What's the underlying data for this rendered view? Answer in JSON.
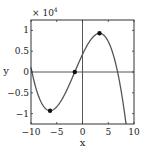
{
  "chart_data": {
    "type": "line",
    "title": "",
    "xlabel": "x",
    "ylabel": "y",
    "y_multiplier_label": "× 10",
    "y_multiplier_exponent": "4",
    "xlim": [
      -10,
      10
    ],
    "ylim": [
      -1.25,
      1.25
    ],
    "y_scale": 10000,
    "grid": false,
    "legend": null,
    "x_ticks": [
      -10,
      -5,
      0,
      5,
      10
    ],
    "x_tick_labels": [
      "−10",
      "−5",
      "0",
      "5",
      "10"
    ],
    "y_ticks": [
      -1,
      -0.5,
      0,
      0.5,
      1
    ],
    "y_tick_labels": [
      "−1",
      "−0.5",
      "0",
      "0.5",
      "1"
    ],
    "reference_lines": {
      "x0": true,
      "y0": true
    },
    "series": [
      {
        "name": "cubic",
        "color": "#555555",
        "function": "y = -42*(x+1.5)^3 + 2903*(x+1.5)",
        "x": [
          -10,
          -9,
          -8,
          -7,
          -6.3,
          -5,
          -4,
          -3,
          -2,
          -1.5,
          -1,
          0,
          1,
          2,
          3,
          3.3,
          4,
          5,
          6,
          7,
          8,
          8.5
        ],
        "y_scaled": [
          0.11,
          -0.34,
          -0.66,
          -0.85,
          -0.93,
          -0.85,
          -0.66,
          -0.42,
          -0.14,
          0.0,
          0.14,
          0.42,
          0.66,
          0.85,
          0.93,
          0.93,
          0.85,
          0.61,
          0.24,
          -0.25,
          -0.87,
          -1.3
        ]
      }
    ],
    "markers": [
      {
        "label": "local minimum",
        "x": -6.3,
        "y_scaled": -0.93
      },
      {
        "label": "inflection point",
        "x": -1.5,
        "y_scaled": 0.0
      },
      {
        "label": "local maximum",
        "x": 3.3,
        "y_scaled": 0.93
      }
    ]
  },
  "colors": {
    "curve": "#555555",
    "axes": "#333333",
    "marker": "#111111",
    "background": "#ffffff"
  }
}
